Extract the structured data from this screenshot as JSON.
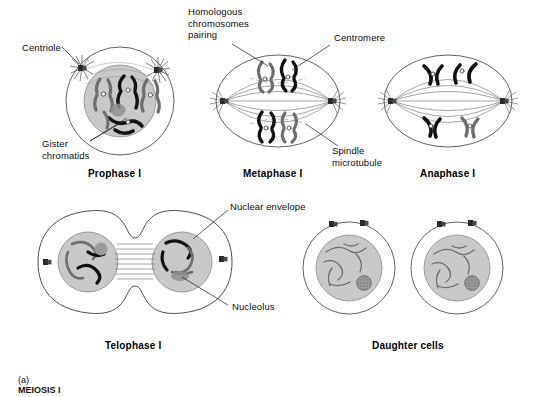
{
  "figure": {
    "caption_prefix": "(a)",
    "caption_text": "MEIOSIS I",
    "background_color": "#ffffff",
    "ink_color": "#1a1a1a"
  },
  "colors": {
    "cytoplasm": "#ffffff",
    "nucleus_fill": "#c9c9c9",
    "nucleus_fill_light": "#d0d0d0",
    "chromosome_dark": "#111111",
    "chromosome_gray": "#6e6e6e",
    "nucleolus": "#9a9a9a",
    "outline": "#222222",
    "spindle": "#3a3a3a"
  },
  "labels": [
    {
      "id": "centriole",
      "text": "Centriole",
      "x": 22,
      "y": 42
    },
    {
      "id": "sister-chromatids",
      "text": "Gister\nchromatids",
      "x": 42,
      "y": 140
    },
    {
      "id": "homologous-chromosomes-pairing",
      "text": "Homologous\nchromosomes\npairing",
      "x": 188,
      "y": 8
    },
    {
      "id": "centromere",
      "text": "Centromere",
      "x": 334,
      "y": 34
    },
    {
      "id": "spindle-microtubule",
      "text": "Spindle\nmicrotubule",
      "x": 332,
      "y": 147
    },
    {
      "id": "nuclear-envelope",
      "text": "Nuclear envelope",
      "x": 230,
      "y": 203
    },
    {
      "id": "nucleolus",
      "text": "Nucleolus",
      "x": 232,
      "y": 304
    }
  ],
  "stages": [
    {
      "id": "prophase-1",
      "label": "Prophase I",
      "x": 96,
      "y": 170
    },
    {
      "id": "metaphase-1",
      "label": "Metaphase I",
      "x": 247,
      "y": 170
    },
    {
      "id": "anaphase-1",
      "label": "Anaphase I",
      "x": 420,
      "y": 170
    },
    {
      "id": "telophase-1",
      "label": "Telophase I",
      "x": 108,
      "y": 342
    },
    {
      "id": "daughter-cells",
      "label": "Daughter cells",
      "x": 378,
      "y": 342
    }
  ],
  "cells": [
    {
      "id": "prophase-1-cell",
      "name": "prophase-cell",
      "type": "round",
      "cx": 120,
      "cy": 101,
      "r_outer": 54,
      "r_nucleus": 36,
      "has_centrioles": true,
      "chromosome_count": 6
    },
    {
      "id": "metaphase-1-cell",
      "name": "metaphase-cell",
      "type": "oval",
      "cx": 278,
      "cy": 101,
      "rx": 62,
      "ry": 46,
      "has_spindle": true,
      "chromosome_count": 4
    },
    {
      "id": "anaphase-1-cell",
      "name": "anaphase-cell",
      "type": "oval",
      "cx": 448,
      "cy": 101,
      "rx": 64,
      "ry": 46,
      "has_spindle": true,
      "chromosome_count": 4
    },
    {
      "id": "telophase-1-cell",
      "name": "telophase-cell",
      "type": "dumbbell",
      "cx": 135,
      "cy": 262,
      "nucleus_left_cx": 88,
      "nucleus_right_cx": 182,
      "r_nucleus": 30
    },
    {
      "id": "daughter-cell-left",
      "name": "daughter-cell",
      "type": "round",
      "cx": 349,
      "cy": 268,
      "r_outer": 46,
      "r_nucleus": 33,
      "has_nucleolus": true
    },
    {
      "id": "daughter-cell-right",
      "name": "daughter-cell",
      "type": "round",
      "cx": 457,
      "cy": 268,
      "r_outer": 46,
      "r_nucleus": 33,
      "has_nucleolus": true
    }
  ]
}
